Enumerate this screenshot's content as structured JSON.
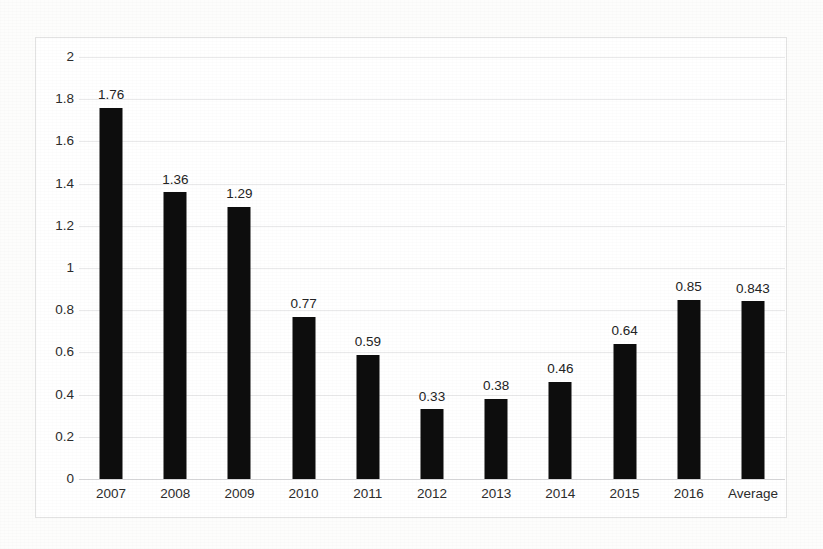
{
  "chart_data": {
    "type": "bar",
    "title": "",
    "subtitle": "",
    "xlabel": "",
    "ylabel": "",
    "categories": [
      "2007",
      "2008",
      "2009",
      "2010",
      "2011",
      "2012",
      "2013",
      "2014",
      "2015",
      "2016",
      "Average"
    ],
    "values": [
      1.76,
      1.36,
      1.29,
      0.77,
      0.59,
      0.33,
      0.38,
      0.46,
      0.64,
      0.85,
      0.843
    ],
    "data_labels": [
      "1.76",
      "1.36",
      "1.29",
      "0.77",
      "0.59",
      "0.33",
      "0.38",
      "0.46",
      "0.64",
      "0.85",
      "0.843"
    ],
    "ylim": [
      0,
      2
    ],
    "ytick_step": 0.2,
    "ytick_labels": [
      "2",
      "1.8",
      "1.6",
      "1.4",
      "1.2",
      "1",
      "0.8",
      "0.6",
      "0.4",
      "0.2",
      "0"
    ],
    "ytick_values": [
      2,
      1.8,
      1.6,
      1.4,
      1.2,
      1,
      0.8,
      0.6,
      0.4,
      0.2,
      0
    ],
    "grid": true,
    "grid_axis": "y",
    "legend": false,
    "legend_position": "none",
    "series": [
      {
        "name": "",
        "values": [
          1.76,
          1.36,
          1.29,
          0.77,
          0.59,
          0.33,
          0.38,
          0.46,
          0.64,
          0.85,
          0.843
        ]
      }
    ],
    "colors": {
      "bar": "#0d0d0d",
      "gridline": "#e9e9ea",
      "axis_text": "#2c2c2c",
      "label_text": "#232323",
      "plot_background": "#ffffff",
      "page_background": "#fdfdfc",
      "frame_border": "#e2e2e2"
    }
  }
}
